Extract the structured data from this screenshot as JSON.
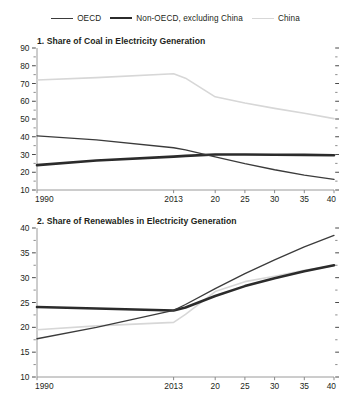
{
  "legend": {
    "position": "top-center",
    "entries": [
      {
        "label": "OECD",
        "key": "oecd",
        "color": "#3b3b3b",
        "width": 1.3
      },
      {
        "label": "Non-OECD, excluding China",
        "key": "nonoecd",
        "color": "#2b2b2b",
        "width": 2.6
      },
      {
        "label": "China",
        "key": "china",
        "color": "#d7d7d7",
        "width": 1.6
      }
    ]
  },
  "chart_data": [
    {
      "type": "line",
      "panel_number": "1.",
      "title": "1. Share of Coal in Electricity Generation",
      "xlabel": "",
      "ylabel": "",
      "xlim": [
        1990,
        2040
      ],
      "ylim": [
        10,
        90
      ],
      "ytick_labels": [
        "90",
        "80",
        "70",
        "60",
        "50",
        "40",
        "30",
        "20",
        "10"
      ],
      "ytick_values": [
        90,
        80,
        70,
        60,
        50,
        40,
        30,
        20,
        10
      ],
      "yminor_step": 5,
      "xtick_labels": [
        "1990",
        "2013",
        "20",
        "25",
        "30",
        "35",
        "40"
      ],
      "xtick_values": [
        1990,
        2013,
        2020,
        2025,
        2030,
        2035,
        2040
      ],
      "grid": false,
      "x": [
        1990,
        2000,
        2013,
        2015,
        2020,
        2025,
        2030,
        2035,
        2040
      ],
      "series": [
        {
          "name": "OECD",
          "color": "#3b3b3b",
          "width": 1.3,
          "values": [
            40.5,
            38.2,
            33.8,
            32.6,
            28.6,
            24.8,
            21.4,
            18.4,
            16.0
          ]
        },
        {
          "name": "Non-OECD, excluding China",
          "color": "#2b2b2b",
          "width": 2.6,
          "values": [
            24.0,
            26.6,
            28.8,
            29.2,
            30.0,
            30.0,
            29.9,
            29.8,
            29.6
          ]
        },
        {
          "name": "China",
          "color": "#d7d7d7",
          "width": 1.6,
          "values": [
            72.0,
            73.3,
            75.5,
            73.0,
            62.5,
            59.0,
            56.0,
            53.2,
            50.2
          ]
        }
      ]
    },
    {
      "type": "line",
      "panel_number": "2.",
      "title": "2. Share of Renewables in Electricity Generation",
      "xlabel": "",
      "ylabel": "",
      "xlim": [
        1990,
        2040
      ],
      "ylim": [
        10,
        40
      ],
      "ytick_labels": [
        "40",
        "35",
        "30",
        "25",
        "20",
        "15",
        "10"
      ],
      "ytick_values": [
        40,
        35,
        30,
        25,
        20,
        15,
        10
      ],
      "yminor_step": 2.5,
      "xtick_labels": [
        "1990",
        "2013",
        "20",
        "25",
        "30",
        "35",
        "40"
      ],
      "xtick_values": [
        1990,
        2013,
        2020,
        2025,
        2030,
        2035,
        2040
      ],
      "grid": false,
      "x": [
        1990,
        2000,
        2013,
        2015,
        2020,
        2025,
        2030,
        2035,
        2040
      ],
      "series": [
        {
          "name": "OECD",
          "color": "#3b3b3b",
          "width": 1.3,
          "values": [
            17.7,
            20.0,
            23.4,
            24.6,
            27.8,
            30.8,
            33.6,
            36.2,
            38.5
          ]
        },
        {
          "name": "Non-OECD, excluding China",
          "color": "#2b2b2b",
          "width": 2.6,
          "values": [
            24.1,
            23.8,
            23.4,
            24.0,
            26.3,
            28.3,
            29.9,
            31.3,
            32.5
          ]
        },
        {
          "name": "China",
          "color": "#d7d7d7",
          "width": 1.6,
          "values": [
            19.5,
            20.3,
            21.0,
            22.6,
            27.2,
            29.2,
            30.3,
            31.5,
            32.4
          ]
        }
      ]
    }
  ]
}
